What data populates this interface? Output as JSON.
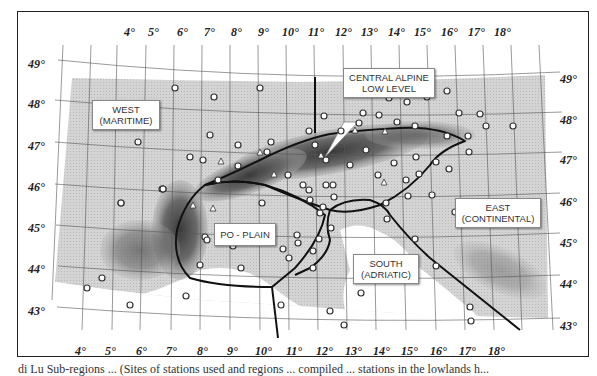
{
  "map": {
    "title": "Alpine climate sub-regions and station network",
    "longitude_labels": [
      "4°",
      "5°",
      "6°",
      "7°",
      "8°",
      "9°",
      "10°",
      "11°",
      "12°",
      "13°",
      "14°",
      "15°",
      "16°",
      "17°",
      "18°"
    ],
    "latitude_labels_left": [
      "49°",
      "48°",
      "47°",
      "46°",
      "45°",
      "44°",
      "43°"
    ],
    "latitude_labels_right": [
      "49°",
      "48°",
      "47°",
      "46°",
      "45°",
      "44°",
      "43°"
    ],
    "regions": {
      "west": {
        "line1": "WEST",
        "line2": "(MARITIME)"
      },
      "central": {
        "line1": "CENTRAL ALPINE",
        "line2": "LOW LEVEL"
      },
      "po": {
        "line1": "PO - PLAIN"
      },
      "east": {
        "line1": "EAST",
        "line2": "(CONTINENTAL)"
      },
      "south": {
        "line1": "SOUTH",
        "line2": "(ADRIATIC)"
      }
    },
    "legend_symbols": {
      "circle": "station (open circle)",
      "triangle": "high-elevation station (triangle)"
    },
    "colors": {
      "land": "#d2d2d2",
      "mountain": "#6e6e6e",
      "sea": "#ffffff",
      "boundary": "#111111",
      "grid": "#555555"
    }
  },
  "caption": {
    "text": "di Lu   Sub-regions ...  (Sites of stations used and regions ... compiled ...   stations in the lowlands h..."
  }
}
